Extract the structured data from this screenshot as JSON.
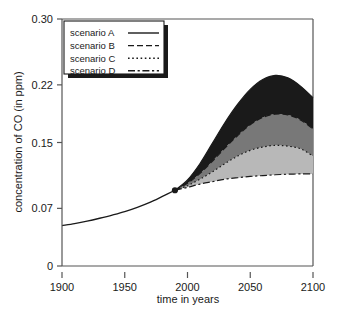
{
  "chart_data": {
    "type": "area",
    "title": "",
    "subtitle": "",
    "xlabel": "time in years",
    "ylabel": "concentration of CO (in ppm)",
    "xlim": [
      1900,
      2100
    ],
    "ylim": [
      0,
      0.3
    ],
    "grid": false,
    "legend_position": "top-left",
    "xticks": [
      1900,
      1950,
      2000,
      2050,
      2100
    ],
    "xtick_labels": [
      "1900",
      "1950",
      "2000",
      "2050",
      "2100"
    ],
    "yticks": [
      0,
      0.07,
      0.15,
      0.22,
      0.3
    ],
    "ytick_labels": [
      "0",
      "0.07",
      "0.15",
      "0.22",
      "0.30"
    ],
    "branch_point": {
      "x": 1990,
      "y": 0.092,
      "marker": "filled-circle"
    },
    "historical": {
      "name": "historical",
      "x": [
        1900,
        1910,
        1920,
        1930,
        1940,
        1950,
        1960,
        1970,
        1980,
        1990
      ],
      "values": [
        0.049,
        0.0515,
        0.0545,
        0.058,
        0.0618,
        0.066,
        0.0712,
        0.0772,
        0.0845,
        0.092
      ]
    },
    "x": [
      1990,
      2000,
      2010,
      2020,
      2030,
      2040,
      2050,
      2060,
      2070,
      2080,
      2090,
      2100
    ],
    "series": [
      {
        "name": "scenario A",
        "line_style": "solid",
        "values": [
          0.092,
          0.1045,
          0.1245,
          0.1495,
          0.1745,
          0.1965,
          0.2145,
          0.2265,
          0.2315,
          0.2285,
          0.2185,
          0.2045
        ]
      },
      {
        "name": "scenario B",
        "line_style": "dashed",
        "values": [
          0.092,
          0.1005,
          0.1125,
          0.1275,
          0.1435,
          0.1585,
          0.1715,
          0.1805,
          0.1845,
          0.1835,
          0.1775,
          0.1665
        ]
      },
      {
        "name": "scenario C",
        "line_style": "dotted",
        "values": [
          0.092,
          0.0975,
          0.1055,
          0.1145,
          0.1245,
          0.1335,
          0.1405,
          0.1445,
          0.1465,
          0.1455,
          0.1425,
          0.1335
        ]
      },
      {
        "name": "scenario D",
        "line_style": "dash-dot",
        "values": [
          0.092,
          0.0955,
          0.0995,
          0.1025,
          0.1055,
          0.1072,
          0.1088,
          0.1098,
          0.1108,
          0.1115,
          0.1118,
          0.1118
        ]
      }
    ],
    "bands": [
      {
        "name": "band-A-B",
        "upper": "scenario A",
        "lower": "scenario B",
        "color": "#1a1a1a"
      },
      {
        "name": "band-B-C",
        "upper": "scenario B",
        "lower": "scenario C",
        "color": "#787878"
      },
      {
        "name": "band-C-D",
        "upper": "scenario C",
        "lower": "scenario D",
        "color": "#b8b8b8"
      }
    ],
    "colors": {
      "axis": "#555555",
      "curve": "#1a1a1a",
      "band_dark": "#1a1a1a",
      "band_mid": "#787878",
      "band_light": "#b8b8b8",
      "background": "#ffffff",
      "legend_shadow": "#1a1a1a"
    }
  },
  "legend": {
    "entries": [
      {
        "label": "scenario A",
        "style": "solid"
      },
      {
        "label": "scenario B",
        "style": "dashed"
      },
      {
        "label": "scenario C",
        "style": "dotted"
      },
      {
        "label": "scenario D",
        "style": "dash-dot"
      }
    ]
  }
}
